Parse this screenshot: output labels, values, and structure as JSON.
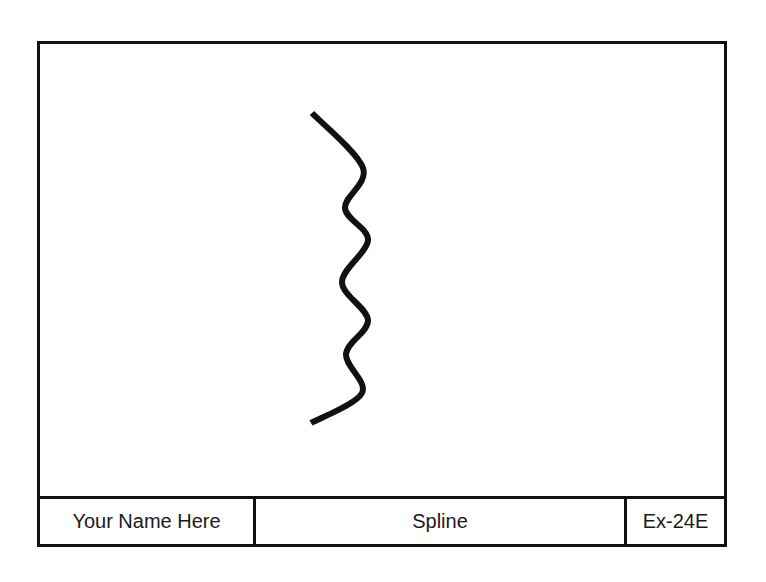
{
  "drawing": {
    "type": "spline",
    "stroke_color": "#111111",
    "stroke_width": 6,
    "points": [
      [
        312,
        113
      ],
      [
        363,
        168
      ],
      [
        345,
        208
      ],
      [
        368,
        240
      ],
      [
        342,
        282
      ],
      [
        368,
        320
      ],
      [
        346,
        354
      ],
      [
        362,
        393
      ],
      [
        311,
        423
      ]
    ]
  },
  "title_block": {
    "name": "Your Name Here",
    "title": "Spline",
    "number": "Ex-24E"
  },
  "colors": {
    "line": "#111111",
    "background": "#ffffff"
  }
}
